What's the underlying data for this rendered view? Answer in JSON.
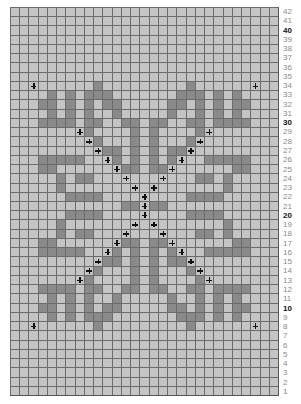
{
  "chart": {
    "title": "",
    "columns": 29,
    "rows": 42,
    "colors": {
      "background": "#c4c4c4",
      "stitch": "#8a8a8a",
      "gridline": "#6b6b6b",
      "cross": "#111111",
      "label": "#8a8a8a",
      "label_bold": "#111111"
    },
    "symmetry": {
      "center_col": 14,
      "center_row": 21
    },
    "quadrant_dark_cells": [
      [
        8,
        9
      ],
      [
        9,
        4
      ],
      [
        9,
        6
      ],
      [
        9,
        8
      ],
      [
        9,
        9
      ],
      [
        9,
        10
      ],
      [
        10,
        3
      ],
      [
        10,
        4
      ],
      [
        10,
        6
      ],
      [
        10,
        8
      ],
      [
        10,
        10
      ],
      [
        10,
        11
      ],
      [
        11,
        4
      ],
      [
        11,
        6
      ],
      [
        11,
        8
      ],
      [
        11,
        11
      ],
      [
        12,
        3
      ],
      [
        12,
        4
      ],
      [
        12,
        5
      ],
      [
        12,
        6
      ],
      [
        12,
        8
      ],
      [
        12,
        9
      ],
      [
        12,
        12
      ],
      [
        12,
        13
      ],
      [
        13,
        8
      ],
      [
        13,
        13
      ],
      [
        14,
        9
      ],
      [
        14,
        13
      ],
      [
        15,
        10
      ],
      [
        15,
        11
      ],
      [
        15,
        13
      ],
      [
        16,
        3
      ],
      [
        16,
        4
      ],
      [
        16,
        5
      ],
      [
        16,
        6
      ],
      [
        16,
        7
      ],
      [
        16,
        11
      ],
      [
        16,
        13
      ],
      [
        17,
        3
      ],
      [
        17,
        4
      ],
      [
        17,
        12
      ],
      [
        17,
        13
      ],
      [
        18,
        5
      ],
      [
        18,
        7
      ],
      [
        18,
        8
      ],
      [
        19,
        5
      ],
      [
        20,
        6
      ],
      [
        20,
        7
      ],
      [
        20,
        8
      ],
      [
        20,
        9
      ],
      [
        21,
        12
      ],
      [
        21,
        13
      ]
    ],
    "quadrant_crosses": [
      [
        8,
        2
      ],
      [
        13,
        7
      ],
      [
        14,
        8
      ],
      [
        15,
        9
      ],
      [
        16,
        10
      ],
      [
        17,
        11
      ],
      [
        18,
        12
      ],
      [
        19,
        13
      ],
      [
        20,
        14
      ],
      [
        21,
        14
      ]
    ],
    "row_labels": [
      "42",
      "41",
      "40",
      "39",
      "38",
      "37",
      "36",
      "35",
      "34",
      "33",
      "32",
      "31",
      "30",
      "29",
      "28",
      "27",
      "26",
      "25",
      "24",
      "23",
      "22",
      "21",
      "20",
      "19",
      "18",
      "17",
      "16",
      "15",
      "14",
      "13",
      "12",
      "11",
      "10",
      "9",
      "8",
      "7",
      "6",
      "5",
      "4",
      "3",
      "2",
      "1"
    ],
    "bold_labels": [
      "40",
      "30",
      "20",
      "10"
    ]
  }
}
